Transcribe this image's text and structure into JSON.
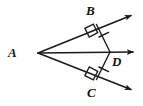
{
  "figure": {
    "kind": "geometry-diagram",
    "width": 143,
    "height": 106,
    "background_color": "#ffffff",
    "stroke_color": "#1a1a1a",
    "label_color": "#111111"
  },
  "labels": {
    "a": "A",
    "b": "B",
    "c": "C",
    "d": "D"
  },
  "label_positions": {
    "a": {
      "x": 8,
      "y": 46
    },
    "b": {
      "x": 86,
      "y": 4
    },
    "c": {
      "x": 87,
      "y": 86
    },
    "d": {
      "x": 112,
      "y": 55
    }
  },
  "points": {
    "A": {
      "x": 38,
      "y": 53
    },
    "B": {
      "x": 97,
      "y": 24
    },
    "C": {
      "x": 97,
      "y": 80
    },
    "D": {
      "x": 110,
      "y": 52
    }
  },
  "rays": [
    {
      "name": "ray-AB",
      "from": "A",
      "through": "B",
      "tip": {
        "x": 136,
        "y": 12
      },
      "arrow": true
    },
    {
      "name": "ray-AD",
      "from": "A",
      "through": "D",
      "tip": {
        "x": 139,
        "y": 52
      },
      "arrow": true
    },
    {
      "name": "ray-AC",
      "from": "A",
      "through": "C",
      "tip": {
        "x": 136,
        "y": 93
      },
      "arrow": true
    }
  ],
  "segments": [
    {
      "name": "segment-DB",
      "from": "D",
      "to": "B",
      "tick_marks": 1
    },
    {
      "name": "segment-DC",
      "from": "D",
      "to": "C",
      "tick_marks": 1
    }
  ],
  "right_angles": [
    {
      "name": "right-angle-at-B",
      "at": "B"
    },
    {
      "name": "right-angle-at-C",
      "at": "C"
    }
  ]
}
